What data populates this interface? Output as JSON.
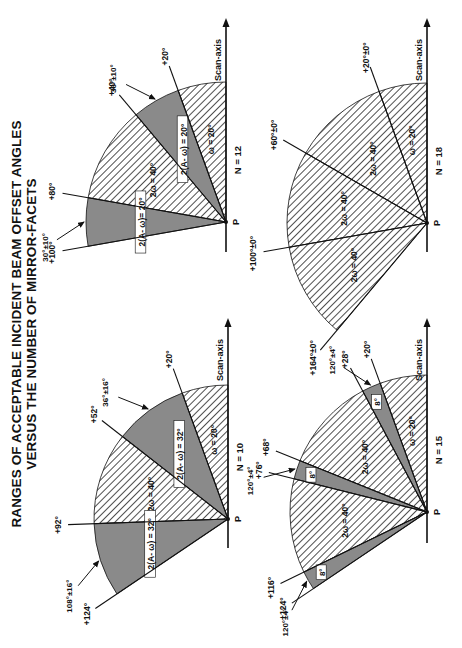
{
  "title": {
    "line1": "RANGES OF ACCEPTABLE INCIDENT BEAM OFFSET ANGLES",
    "line2": "VERSUS  THE NUMBER OF MIRROR-FACETS"
  },
  "common": {
    "axis_label": "Scan-axis",
    "origin_label": "P"
  },
  "colors": {
    "hatch": "#222222",
    "shade": "#8a8a8a",
    "line": "#111111"
  },
  "panels": [
    {
      "id": "n10",
      "n_label": "N = 10",
      "rays": [
        {
          "angle": 20,
          "label": "+20°"
        },
        {
          "angle": 52,
          "label": "+52°"
        },
        {
          "angle": 92,
          "label": "+92°"
        },
        {
          "angle": 124,
          "label": "+124°"
        }
      ],
      "regions": [
        {
          "from": 0,
          "to": 20,
          "type": "hatch",
          "label": "ω = 20°"
        },
        {
          "from": 20,
          "to": 52,
          "type": "shade",
          "label": "2(A- ω) = 32°"
        },
        {
          "from": 52,
          "to": 92,
          "type": "hatch",
          "label": "2ω = 40°"
        },
        {
          "from": 92,
          "to": 124,
          "type": "shade",
          "label": "2(A- ω) = 32°"
        }
      ],
      "pointers": [
        {
          "label": "36°±16°",
          "target_angle": 36
        },
        {
          "label": "108°±16°",
          "target_angle": 108
        }
      ]
    },
    {
      "id": "n12",
      "n_label": "N = 12",
      "rays": [
        {
          "angle": 20,
          "label": "+20°"
        },
        {
          "angle": 40,
          "label": "+40°"
        },
        {
          "angle": 80,
          "label": "+80°"
        },
        {
          "angle": 100,
          "label": "+100°"
        }
      ],
      "regions": [
        {
          "from": 0,
          "to": 20,
          "type": "hatch",
          "label": "ω = 20°"
        },
        {
          "from": 20,
          "to": 40,
          "type": "shade",
          "label": "2(A- ω) = 20°"
        },
        {
          "from": 40,
          "to": 80,
          "type": "hatch",
          "label": "2ω = 40°"
        },
        {
          "from": 80,
          "to": 100,
          "type": "shade",
          "label": "2(A- ω)= 20°"
        }
      ],
      "pointers": [
        {
          "label": "30°±10°",
          "target_angle": 30
        },
        {
          "label": "30°±10°",
          "target_angle": 90
        }
      ]
    },
    {
      "id": "n15",
      "n_label": "N = 15",
      "rays": [
        {
          "angle": 20,
          "label": "+20°"
        },
        {
          "angle": 28,
          "label": "+28°"
        },
        {
          "angle": 68,
          "label": "+68°"
        },
        {
          "angle": 76,
          "label": "+76°"
        },
        {
          "angle": 116,
          "label": "+116°"
        },
        {
          "angle": 124,
          "label": "+124°"
        }
      ],
      "regions": [
        {
          "from": 0,
          "to": 20,
          "type": "hatch",
          "label": "ω = 20°"
        },
        {
          "from": 20,
          "to": 28,
          "type": "shade",
          "label": "8°"
        },
        {
          "from": 28,
          "to": 68,
          "type": "hatch",
          "label": "2ω = 40°"
        },
        {
          "from": 68,
          "to": 76,
          "type": "shade",
          "label": "8°"
        },
        {
          "from": 76,
          "to": 116,
          "type": "hatch",
          "label": "2ω = 40°"
        },
        {
          "from": 116,
          "to": 124,
          "type": "shade",
          "label": "8°"
        }
      ],
      "pointers": [
        {
          "label": "120°±4°",
          "target_angle": 24
        },
        {
          "label": "120°±4°",
          "target_angle": 72
        },
        {
          "label": "120°±4°",
          "target_angle": 120
        }
      ]
    },
    {
      "id": "n18",
      "n_label": "N = 18",
      "rays": [
        {
          "angle": 20,
          "label": "+20°±0°"
        },
        {
          "angle": 60,
          "label": "+60°±0°"
        },
        {
          "angle": 100,
          "label": "+100°±0°"
        },
        {
          "angle": 140,
          "label": "+164°±0°"
        }
      ],
      "regions": [
        {
          "from": 0,
          "to": 20,
          "type": "hatch",
          "label": "ω = 20°"
        },
        {
          "from": 20,
          "to": 60,
          "type": "hatch",
          "label": "2ω = 40°"
        },
        {
          "from": 60,
          "to": 100,
          "type": "hatch",
          "label": "2ω = 40°"
        },
        {
          "from": 100,
          "to": 140,
          "type": "hatch",
          "label": "2ω = 40°"
        }
      ],
      "pointers": []
    }
  ]
}
